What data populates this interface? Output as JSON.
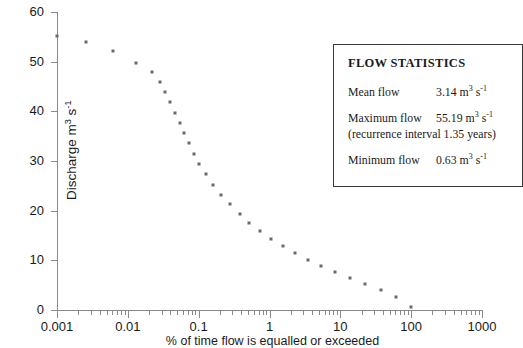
{
  "chart_data": {
    "type": "scatter",
    "title": "",
    "xlabel": "% of time flow is equalled or exceeded",
    "ylabel_text": "Discharge m",
    "ylabel_sup": "3",
    "ylabel_mid": " s",
    "ylabel_sup2": "-1",
    "xscale": "log",
    "xlim": [
      0.001,
      1000
    ],
    "ylim": [
      0,
      60
    ],
    "xticks": [
      0.001,
      0.01,
      0.1,
      1,
      10,
      100,
      1000
    ],
    "xticklabels": [
      "0.001",
      "0.01",
      "0.1",
      "1",
      "10",
      "100",
      "1000"
    ],
    "yticks": [
      0,
      10,
      20,
      30,
      40,
      50,
      60
    ],
    "yticklabels": [
      "0",
      "10",
      "20",
      "30",
      "40",
      "50",
      "60"
    ],
    "grid": false,
    "legend": "none",
    "marker_color": "#6a6a6a",
    "x": [
      0.001,
      0.0026,
      0.0062,
      0.013,
      0.022,
      0.028,
      0.034,
      0.04,
      0.047,
      0.055,
      0.063,
      0.073,
      0.085,
      0.1,
      0.125,
      0.16,
      0.21,
      0.28,
      0.38,
      0.52,
      0.73,
      1.05,
      1.55,
      2.3,
      3.5,
      5.4,
      8.5,
      13.5,
      22,
      37,
      62,
      100
    ],
    "y": [
      55.19,
      53.9,
      52.1,
      49.8,
      48.0,
      46.0,
      43.8,
      41.8,
      39.6,
      37.7,
      35.6,
      33.6,
      31.5,
      29.4,
      27.3,
      25.2,
      23.2,
      21.3,
      19.4,
      17.6,
      15.9,
      14.3,
      12.8,
      11.4,
      10.1,
      8.8,
      7.6,
      6.4,
      5.2,
      4.0,
      2.7,
      0.63
    ]
  },
  "stats_box": {
    "title": "FLOW STATISTICS",
    "mean_label": "Mean flow",
    "mean_value": "3.14 m",
    "mean_unit_sup": "3",
    "mean_unit_s": " s",
    "mean_unit_sup2": "-1",
    "max_label": "Maximum flow",
    "max_value": "55.19 m",
    "max_unit_sup": "3",
    "max_unit_s": " s",
    "max_unit_sup2": "-1",
    "recurrence_note": "(recurrence interval 1.35 years)",
    "min_label": "Minimum flow",
    "min_value": "0.63 m",
    "min_unit_sup": "3",
    "min_unit_s": " s",
    "min_unit_sup2": "-1"
  }
}
